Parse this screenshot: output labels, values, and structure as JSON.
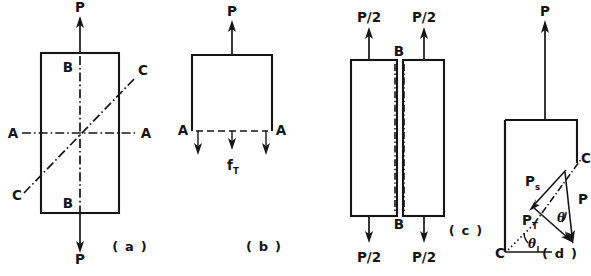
{
  "figure": {
    "ink_color": "#151515",
    "background_color": "#ffffff",
    "panels": [
      {
        "id": "a",
        "caption": "( a )",
        "description": "Rectangular bar in tension with section planes A-A, B-B and C-C",
        "labels": {
          "force_top": "P",
          "force_bottom": "P",
          "section_b_top": "B",
          "section_b_bottom": "B",
          "section_a_left": "A",
          "section_a_right": "A",
          "section_c_upper": "C",
          "section_c_lower": "C"
        }
      },
      {
        "id": "b",
        "caption": "( b )",
        "description": "Free body above section A-A showing normal tensile stress",
        "labels": {
          "force_top": "P",
          "section_a_left": "A",
          "section_a_right": "A",
          "stress": "f",
          "stress_subscript": "T"
        }
      },
      {
        "id": "c",
        "caption": "( c )",
        "description": "Bar split along longitudinal section B-B into two halves",
        "labels": {
          "force_top_left": "P/2",
          "force_top_right": "P/2",
          "force_bottom_left": "P/2",
          "force_bottom_right": "P/2",
          "section_b_top": "B",
          "section_b_bottom": "B"
        }
      },
      {
        "id": "d",
        "caption": "( d )",
        "description": "Free body cut on inclined plane C-C with force resolved into normal and tangential components",
        "labels": {
          "force_top": "P",
          "section_c": "C",
          "section_c_corner": "C",
          "component_normal": "P",
          "component_normal_subscript": "s",
          "component_tangential": "P",
          "component_tangential_subscript": "T",
          "resultant": "P",
          "angle_lower": "θ",
          "angle_upper": "θ"
        }
      }
    ]
  }
}
